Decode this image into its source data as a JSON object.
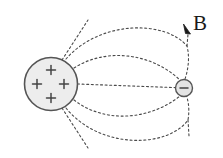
{
  "figure": {
    "background_color": "#ffffff",
    "width": 223,
    "height": 158
  },
  "labels": {
    "field_label": "B"
  },
  "positive_sphere": {
    "name": "positively-charged-sphere",
    "cx": 51,
    "cy": 84,
    "r": 26.5,
    "fill_color": "#ededed",
    "stroke_color": "#555555",
    "charge_symbol": "+",
    "charge_count": 4,
    "charge_color": "#444444",
    "charge_positions": [
      {
        "x": 51,
        "y": 70
      },
      {
        "x": 37,
        "y": 84
      },
      {
        "x": 64,
        "y": 84
      },
      {
        "x": 51,
        "y": 98
      }
    ]
  },
  "negative_charge": {
    "name": "negative-point-charge",
    "cx": 184,
    "cy": 88,
    "r": 8.5,
    "fill_color": "#e4e4e4",
    "stroke_color": "#555555",
    "charge_symbol": "−",
    "charge_color": "#444444"
  },
  "field_lines": {
    "style": "dashed",
    "color": "#4a4a4a",
    "dash_pattern": "2 2.6",
    "stroke_width": 1.1,
    "arrowhead": {
      "name": "field-direction-arrowhead",
      "x": 188,
      "y": 32,
      "color": "#1a1a1a"
    },
    "paths": [
      {
        "id": "line-straight-mid",
        "d": "M 77.5 84 L 175.5 87.6"
      },
      {
        "id": "line-upper-inner",
        "d": "M 74 68 C 105 48, 150 52, 180 80"
      },
      {
        "id": "line-upper-outer",
        "d": "M 66 59 C 100 20, 165 20, 187 46 C 190 58, 188 70, 185 79"
      },
      {
        "id": "line-lower-inner",
        "d": "M 74 100 C 105 124, 150 120, 180 96"
      },
      {
        "id": "line-lower-outer",
        "d": "M 66 108 C 100 150, 168 148, 188 120 C 190 108, 188 98, 185 93"
      },
      {
        "id": "ray-top-left",
        "d": "M 62 60 L 88 20"
      },
      {
        "id": "ray-bottom-left",
        "d": "M 62 108 L 88 148"
      },
      {
        "id": "ray-upper-vertical-to-b",
        "d": "M 187 46 L 188 34"
      },
      {
        "id": "ray-lower-vertical",
        "d": "M 188 120 L 189 136"
      }
    ]
  }
}
